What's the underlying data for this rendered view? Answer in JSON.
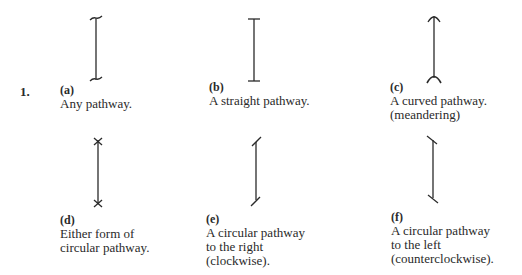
{
  "figure": {
    "number": "1.",
    "items": [
      {
        "letter": "(a)",
        "lines": [
          "Any pathway.",
          "",
          ""
        ],
        "symbol": "any-pathway"
      },
      {
        "letter": "(b)",
        "lines": [
          "A straight pathway.",
          "",
          ""
        ],
        "symbol": "straight-pathway"
      },
      {
        "letter": "(c)",
        "lines": [
          "A curved pathway.",
          "(meandering)",
          ""
        ],
        "symbol": "curved-pathway"
      },
      {
        "letter": "(d)",
        "lines": [
          "Either form of",
          "circular pathway.",
          ""
        ],
        "symbol": "circular-either"
      },
      {
        "letter": "(e)",
        "lines": [
          "A circular pathway",
          "to the right",
          "(clockwise)."
        ],
        "symbol": "circular-right"
      },
      {
        "letter": "(f)",
        "lines": [
          "A circular pathway",
          "to the left",
          "(counterclockwise)."
        ],
        "symbol": "circular-left"
      }
    ]
  }
}
